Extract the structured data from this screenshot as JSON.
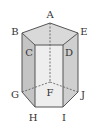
{
  "figure": {
    "type": "pentagonal-prism",
    "labels": {
      "A": "A",
      "B": "B",
      "C": "C",
      "D": "D",
      "E": "E",
      "F": "F",
      "G": "G",
      "H": "H",
      "I": "I",
      "J": "J"
    },
    "colors": {
      "edge": "#555555",
      "top_face": "#d9d9d9",
      "front_face": "#eeeeee",
      "left_face": "#c4c4c4",
      "right_face": "#cfcfcf",
      "label": "#333333"
    }
  }
}
